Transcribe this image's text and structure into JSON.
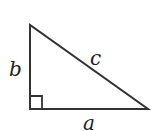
{
  "diagram": {
    "type": "right-triangle",
    "labels": {
      "leg_vertical": "b",
      "hypotenuse": "c",
      "leg_horizontal": "a"
    },
    "right_angle_marker": true,
    "stroke_color": "#333333"
  }
}
